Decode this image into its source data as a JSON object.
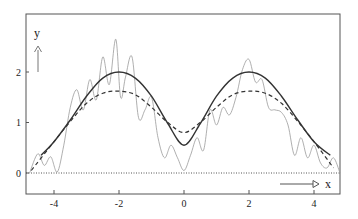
{
  "chart_data": {
    "type": "line",
    "title": "",
    "xlabel": "x",
    "ylabel": "y",
    "xlim": [
      -4.8,
      4.85
    ],
    "ylim": [
      -0.42,
      3.14
    ],
    "grid": false,
    "legend": null,
    "x_ticks": [
      -4,
      -2,
      0,
      2,
      4
    ],
    "x_tick_labels": [
      "-4",
      "-2",
      "0",
      "2",
      "4"
    ],
    "y_ticks": [
      0,
      1,
      2
    ],
    "y_tick_labels": [
      "0",
      "1",
      "2"
    ],
    "baseline": {
      "y": 0,
      "style": "dotted"
    },
    "series": [
      {
        "name": "true function",
        "style": "solid",
        "color": "#333333",
        "description": "smooth curve, peaks ≈2.0 at x=±2, minimum ≈0.55 at x=0",
        "x": [
          -4.4,
          -4,
          -3.5,
          -3,
          -2.5,
          -2,
          -1.5,
          -1,
          -0.5,
          0,
          0.5,
          1,
          1.5,
          2,
          2.5,
          3,
          3.5,
          4,
          4.5
        ],
        "y": [
          0.35,
          0.62,
          1.05,
          1.52,
          1.88,
          2.0,
          1.88,
          1.52,
          0.98,
          0.55,
          0.98,
          1.52,
          1.88,
          2.0,
          1.88,
          1.52,
          1.05,
          0.62,
          0.35
        ]
      },
      {
        "name": "smoothed estimate",
        "style": "dashed",
        "color": "#333333",
        "description": "dashed curve, peaks ≈1.62 at x=±2, minimum ≈0.8 at x=0",
        "x": [
          -4.7,
          -4,
          -3.5,
          -3,
          -2.5,
          -2,
          -1.5,
          -1,
          -0.5,
          0,
          0.5,
          1,
          1.5,
          2,
          2.5,
          3,
          3.5,
          4,
          4.6
        ],
        "y": [
          0.05,
          0.62,
          1.02,
          1.38,
          1.58,
          1.62,
          1.55,
          1.3,
          1.0,
          0.8,
          1.0,
          1.3,
          1.55,
          1.62,
          1.58,
          1.38,
          1.02,
          0.62,
          0.1
        ]
      },
      {
        "name": "noisy data",
        "style": "thin-gray",
        "color": "#999999",
        "description": "rough oscillating curve around the true function, max ≈2.65 near x=-2",
        "x": [
          -4.75,
          -4.5,
          -4.3,
          -4.1,
          -3.9,
          -3.7,
          -3.5,
          -3.3,
          -3.1,
          -2.9,
          -2.7,
          -2.5,
          -2.3,
          -2.1,
          -1.95,
          -1.8,
          -1.6,
          -1.4,
          -1.2,
          -1.0,
          -0.8,
          -0.6,
          -0.4,
          -0.2,
          0,
          0.2,
          0.4,
          0.6,
          0.8,
          1.0,
          1.2,
          1.4,
          1.6,
          1.8,
          2.0,
          2.2,
          2.4,
          2.6,
          2.8,
          3.0,
          3.2,
          3.4,
          3.6,
          3.8,
          4.0,
          4.2,
          4.4,
          4.6,
          4.8
        ],
        "y": [
          0.0,
          0.38,
          0.15,
          0.32,
          0.02,
          0.55,
          1.3,
          1.65,
          1.25,
          1.85,
          1.45,
          2.3,
          1.75,
          2.65,
          1.5,
          1.9,
          2.3,
          1.1,
          1.25,
          1.5,
          0.7,
          0.3,
          0.55,
          0.3,
          0.05,
          0.35,
          0.7,
          0.45,
          1.25,
          0.95,
          1.3,
          1.15,
          1.5,
          2.05,
          2.25,
          1.8,
          1.85,
          1.3,
          1.25,
          1.2,
          0.95,
          0.35,
          0.7,
          0.3,
          0.55,
          0.2,
          0.1,
          0.3,
          0.0
        ]
      }
    ],
    "annotations": [
      {
        "text": "y",
        "type": "axis-arrow",
        "direction": "up"
      },
      {
        "text": "x",
        "type": "axis-arrow",
        "direction": "right"
      }
    ]
  },
  "labels": {
    "x_axis_name": "x",
    "y_axis_name": "y",
    "x_tick_labels": [
      "-4",
      "-2",
      "0",
      "2",
      "4"
    ],
    "y_tick_labels": [
      "0",
      "1",
      "2"
    ]
  }
}
